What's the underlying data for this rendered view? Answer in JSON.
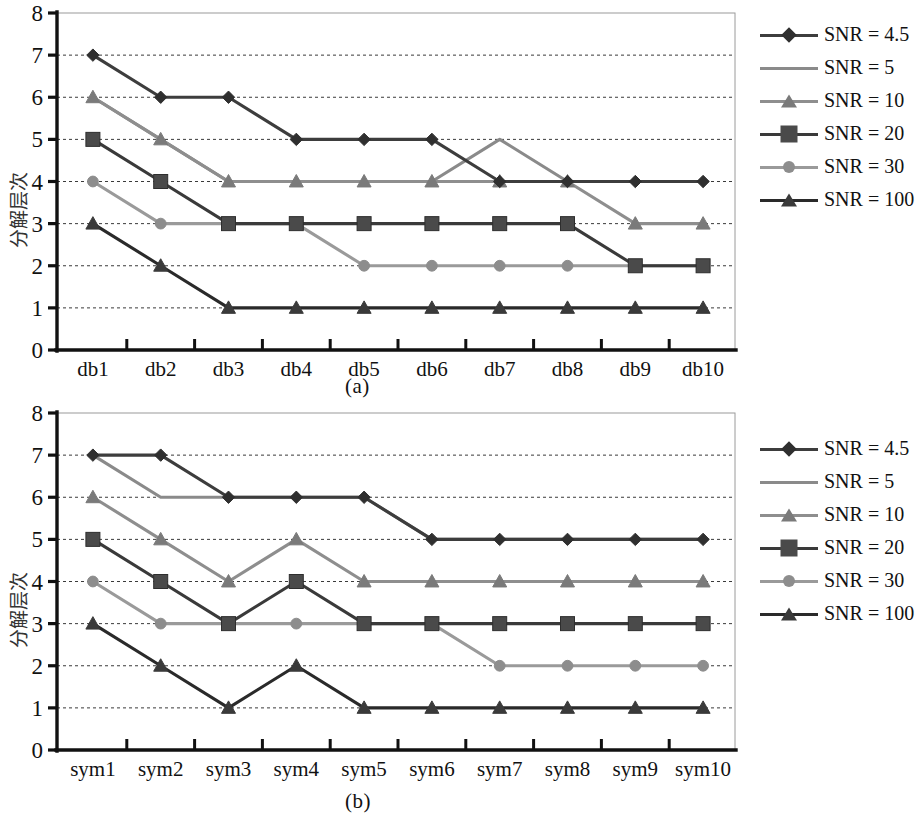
{
  "figure": {
    "ylabel": "分解层次",
    "caption_a": "(a)",
    "caption_b": "(b)"
  },
  "series_styles": {
    "SNR = 4.5": {
      "color": "#3d3d3d",
      "marker": "diamond",
      "marker_color": "#2f2f2f"
    },
    "SNR = 5": {
      "color": "#8a8a8a",
      "marker": "none",
      "marker_color": "#8a8a8a"
    },
    "SNR = 10": {
      "color": "#8e8e8e",
      "marker": "triangle",
      "marker_color": "#7a7a7a"
    },
    "SNR = 20": {
      "color": "#3a3a3a",
      "marker": "square",
      "marker_color": "#4a4a4a"
    },
    "SNR = 30": {
      "color": "#9a9a9a",
      "marker": "circle",
      "marker_color": "#8d8d8d"
    },
    "SNR = 100": {
      "color": "#2a2a2a",
      "marker": "triangle",
      "marker_color": "#3a3a3a"
    }
  },
  "legend": {
    "entries": [
      {
        "label": "SNR = 4.5"
      },
      {
        "label": "SNR = 5"
      },
      {
        "label": "SNR = 10"
      },
      {
        "label": "SNR = 20"
      },
      {
        "label": "SNR = 30"
      },
      {
        "label": "SNR = 100"
      }
    ]
  },
  "chart_data": [
    {
      "type": "line",
      "panel": "(a)",
      "title": "",
      "xlabel": "",
      "ylabel": "分解层次",
      "ylim": [
        0,
        8
      ],
      "yticks": [
        0,
        1,
        2,
        3,
        4,
        5,
        6,
        7,
        8
      ],
      "grid": true,
      "legend_position": "right",
      "categories": [
        "db1",
        "db2",
        "db3",
        "db4",
        "db5",
        "db6",
        "db7",
        "db8",
        "db9",
        "db10"
      ],
      "series": [
        {
          "name": "SNR = 4.5",
          "values": [
            7,
            6,
            6,
            5,
            5,
            5,
            4,
            4,
            4,
            4
          ]
        },
        {
          "name": "SNR = 5",
          "values": [
            6,
            5,
            4,
            4,
            4,
            4,
            5,
            4,
            4,
            4
          ]
        },
        {
          "name": "SNR = 10",
          "values": [
            6,
            5,
            4,
            4,
            4,
            4,
            4,
            4,
            3,
            3
          ]
        },
        {
          "name": "SNR = 20",
          "values": [
            5,
            4,
            3,
            3,
            3,
            3,
            3,
            3,
            2,
            2
          ]
        },
        {
          "name": "SNR = 30",
          "values": [
            4,
            3,
            3,
            3,
            2,
            2,
            2,
            2,
            2,
            2
          ]
        },
        {
          "name": "SNR = 100",
          "values": [
            3,
            2,
            1,
            1,
            1,
            1,
            1,
            1,
            1,
            1
          ]
        }
      ]
    },
    {
      "type": "line",
      "panel": "(b)",
      "title": "",
      "xlabel": "",
      "ylabel": "分解层次",
      "ylim": [
        0,
        8
      ],
      "yticks": [
        0,
        1,
        2,
        3,
        4,
        5,
        6,
        7,
        8
      ],
      "grid": true,
      "legend_position": "right",
      "categories": [
        "sym1",
        "sym2",
        "sym3",
        "sym4",
        "sym5",
        "sym6",
        "sym7",
        "sym8",
        "sym9",
        "sym10"
      ],
      "series": [
        {
          "name": "SNR = 4.5",
          "values": [
            7,
            7,
            6,
            6,
            6,
            5,
            5,
            5,
            5,
            5
          ]
        },
        {
          "name": "SNR = 5",
          "values": [
            7,
            6,
            6,
            6,
            6,
            5,
            5,
            5,
            5,
            5
          ]
        },
        {
          "name": "SNR = 10",
          "values": [
            6,
            5,
            4,
            5,
            4,
            4,
            4,
            4,
            4,
            4
          ]
        },
        {
          "name": "SNR = 20",
          "values": [
            5,
            4,
            3,
            4,
            3,
            3,
            3,
            3,
            3,
            3
          ]
        },
        {
          "name": "SNR = 30",
          "values": [
            4,
            3,
            3,
            3,
            3,
            3,
            2,
            2,
            2,
            2
          ]
        },
        {
          "name": "SNR = 100",
          "values": [
            3,
            2,
            1,
            2,
            1,
            1,
            1,
            1,
            1,
            1
          ]
        }
      ]
    }
  ]
}
